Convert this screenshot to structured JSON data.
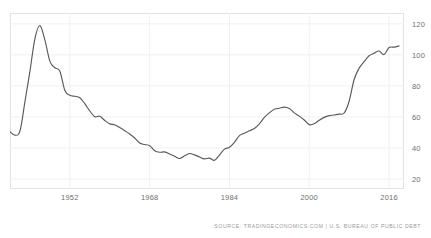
{
  "chart_data": {
    "type": "line",
    "title": "",
    "subtitle": "",
    "xlabel": "",
    "ylabel": "",
    "xlim": [
      1940,
      2019
    ],
    "ylim": [
      13.5,
      127
    ],
    "grid": true,
    "legend": null,
    "line_color": "#5a5a5a",
    "background_color": "#ffffff",
    "grid_color": "#f0f0f0",
    "frame_color": "#e2e2e2",
    "x_ticks": [
      1952,
      1968,
      1984,
      2000,
      2016
    ],
    "x_tick_labels": [
      "1952",
      "1968",
      "1984",
      "2000",
      "2016"
    ],
    "y_ticks": [
      20,
      40,
      60,
      80,
      100,
      120
    ],
    "y_tick_labels": [
      "20",
      "40",
      "60",
      "80",
      "100",
      "120"
    ],
    "series": [
      {
        "name": "US Government Debt to GDP",
        "x": [
          1940,
          1941,
          1942,
          1943,
          1944,
          1945,
          1946,
          1947,
          1948,
          1949,
          1950,
          1951,
          1952,
          1953,
          1954,
          1955,
          1956,
          1957,
          1958,
          1959,
          1960,
          1961,
          1962,
          1963,
          1964,
          1965,
          1966,
          1967,
          1968,
          1969,
          1970,
          1971,
          1972,
          1973,
          1974,
          1975,
          1976,
          1977,
          1978,
          1979,
          1980,
          1981,
          1982,
          1983,
          1984,
          1985,
          1986,
          1987,
          1988,
          1989,
          1990,
          1991,
          1992,
          1993,
          1994,
          1995,
          1996,
          1997,
          1998,
          1999,
          2000,
          2001,
          2002,
          2003,
          2004,
          2005,
          2006,
          2007,
          2008,
          2009,
          2010,
          2011,
          2012,
          2013,
          2014,
          2015,
          2016,
          2017,
          2018
        ],
        "values": [
          50.4,
          48.2,
          50.9,
          69.8,
          89.5,
          110.5,
          118.9,
          109.5,
          95.8,
          91.7,
          89.5,
          77.0,
          73.9,
          73.3,
          72.4,
          68.5,
          63.8,
          60.1,
          60.4,
          57.7,
          55.5,
          54.9,
          53.1,
          51.1,
          49.0,
          46.4,
          43.1,
          42.2,
          41.4,
          38.2,
          37.2,
          37.4,
          36.1,
          34.6,
          33.2,
          34.9,
          36.4,
          35.5,
          34.1,
          32.9,
          33.4,
          32.0,
          35.4,
          39.2,
          40.4,
          43.6,
          47.9,
          49.5,
          51.0,
          52.5,
          55.5,
          59.7,
          62.6,
          64.9,
          65.6,
          66.3,
          65.4,
          62.6,
          60.5,
          58.0,
          55.0,
          55.6,
          57.9,
          59.7,
          60.8,
          61.2,
          61.8,
          62.5,
          70.1,
          84.1,
          91.4,
          95.6,
          99.4,
          101.0,
          102.5,
          100.2,
          104.7,
          105.0,
          105.8
        ]
      }
    ]
  },
  "footer": {
    "source": "SOURCE: TRADINGECONOMICS.COM | U.S. BUREAU OF PUBLIC DEBT"
  }
}
